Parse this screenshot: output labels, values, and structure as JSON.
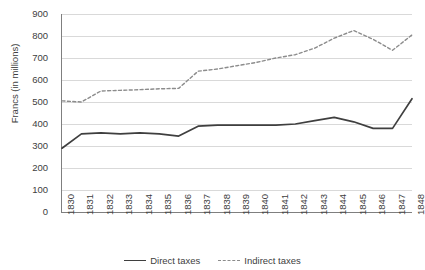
{
  "chart_data": {
    "type": "line",
    "title": "",
    "xlabel": "",
    "ylabel": "Francs (in millions)",
    "ylim": [
      0,
      900
    ],
    "ytick_step": 100,
    "yticks": [
      "900",
      "800",
      "700",
      "600",
      "500",
      "400",
      "300",
      "200",
      "100",
      "0"
    ],
    "grid": true,
    "legend_position": "bottom",
    "categories": [
      "1830",
      "1831",
      "1832",
      "1833",
      "1834",
      "1835",
      "1836",
      "1837",
      "1838",
      "1839",
      "1840",
      "1841",
      "1842",
      "1843",
      "1844",
      "1845",
      "1846",
      "1847",
      "1848"
    ],
    "series": [
      {
        "name": "Direct taxes",
        "style": "solid",
        "color": "#3f3f3f",
        "values": [
          290,
          355,
          360,
          355,
          360,
          355,
          345,
          390,
          395,
          395,
          395,
          395,
          400,
          415,
          430,
          410,
          380,
          380,
          515
        ]
      },
      {
        "name": "Indirect taxes",
        "style": "dashed",
        "color": "#8c8c8c",
        "values": [
          505,
          500,
          550,
          553,
          556,
          560,
          562,
          640,
          650,
          665,
          680,
          700,
          715,
          745,
          790,
          825,
          785,
          735,
          805
        ]
      }
    ]
  },
  "legend": {
    "entries": [
      {
        "label": "Direct taxes"
      },
      {
        "label": "Indirect taxes"
      }
    ]
  },
  "axes": {
    "y_title": "Francs (in millions)"
  }
}
